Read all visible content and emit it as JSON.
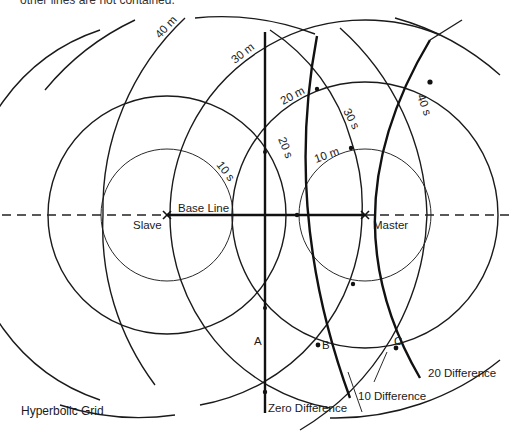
{
  "top_text": "other lines are not contained.",
  "figure": {
    "caption": "Hyperbolic Grid",
    "stations": {
      "slave": {
        "label": "Slave",
        "x": 167,
        "y": 215
      },
      "master": {
        "label": "Master",
        "x": 365,
        "y": 215
      }
    },
    "baseline_label": "Base Line",
    "slave_range_labels": [
      "10 s",
      "20 s",
      "30 s",
      "40 s"
    ],
    "master_range_labels": [
      "10 m",
      "20 m",
      "30 m",
      "40 m"
    ],
    "points": {
      "a": "A",
      "b": "B",
      "c": "C"
    },
    "difference_labels": {
      "zero": "Zero Difference",
      "ten": "10 Difference",
      "twenty": "20 Difference"
    },
    "colors": {
      "ink": "#1a1a1a",
      "background": "#ffffff"
    }
  }
}
